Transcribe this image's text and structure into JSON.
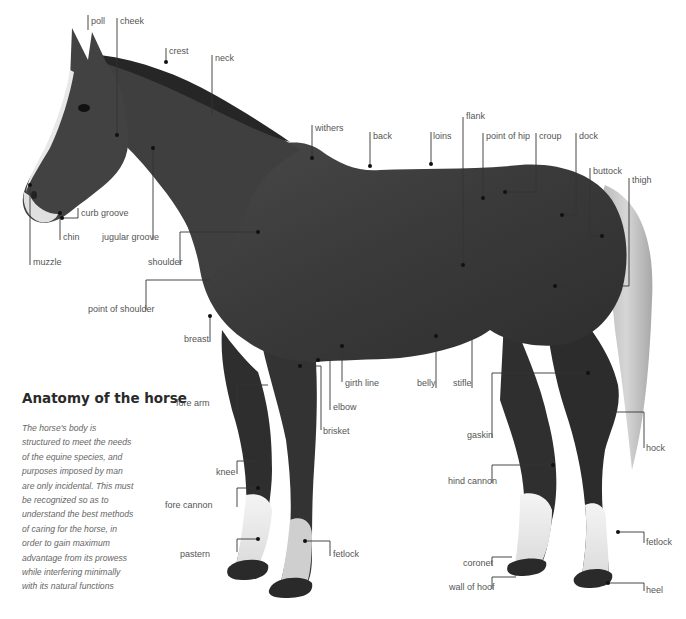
{
  "title": "Anatomy of the horse",
  "description": "The horse's body is structured to meet the needs of the equine species, and purposes imposed by man are only incidental. This must be recognized so as to understand the best methods of caring for the horse, in order to gain maximum advantage from its prowess while interfering minimally with its natural functions",
  "colors": {
    "ink": "#2a2a2a",
    "label": "#555555",
    "horse_body": "#3d3d3d",
    "white_markings": "#eeeeee",
    "background": "#ffffff"
  },
  "labels": [
    {
      "id": "poll",
      "text": "poll"
    },
    {
      "id": "cheek",
      "text": "cheek"
    },
    {
      "id": "crest",
      "text": "crest"
    },
    {
      "id": "neck",
      "text": "neck"
    },
    {
      "id": "curb-groove",
      "text": "curb groove"
    },
    {
      "id": "chin",
      "text": "chin"
    },
    {
      "id": "muzzle",
      "text": "muzzle"
    },
    {
      "id": "jugular-groove",
      "text": "jugular groove"
    },
    {
      "id": "shoulder",
      "text": "shoulder"
    },
    {
      "id": "point-of-shoulder",
      "text": "point of shoulder"
    },
    {
      "id": "breast",
      "text": "breast"
    },
    {
      "id": "withers",
      "text": "withers"
    },
    {
      "id": "back",
      "text": "back"
    },
    {
      "id": "loins",
      "text": "loins"
    },
    {
      "id": "flank",
      "text": "flank"
    },
    {
      "id": "point-of-hip",
      "text": "point of hip"
    },
    {
      "id": "croup",
      "text": "croup"
    },
    {
      "id": "dock",
      "text": "dock"
    },
    {
      "id": "buttock",
      "text": "buttock"
    },
    {
      "id": "thigh",
      "text": "thigh"
    },
    {
      "id": "fore-arm",
      "text": "fore arm"
    },
    {
      "id": "girth-line",
      "text": "girth line"
    },
    {
      "id": "elbow",
      "text": "elbow"
    },
    {
      "id": "brisket",
      "text": "brisket"
    },
    {
      "id": "belly",
      "text": "belly"
    },
    {
      "id": "stifle",
      "text": "stifle"
    },
    {
      "id": "gaskin",
      "text": "gaskin"
    },
    {
      "id": "hock",
      "text": "hock"
    },
    {
      "id": "hind-cannon",
      "text": "hind cannon"
    },
    {
      "id": "knee",
      "text": "knee"
    },
    {
      "id": "fore-cannon",
      "text": "fore cannon"
    },
    {
      "id": "pastern",
      "text": "pastern"
    },
    {
      "id": "fetlock-fore",
      "text": "fetlock"
    },
    {
      "id": "fetlock-hind",
      "text": "fetlock"
    },
    {
      "id": "coronet",
      "text": "coronet"
    },
    {
      "id": "wall-of-hoof",
      "text": "wall of hoof"
    },
    {
      "id": "heel",
      "text": "heel"
    }
  ]
}
